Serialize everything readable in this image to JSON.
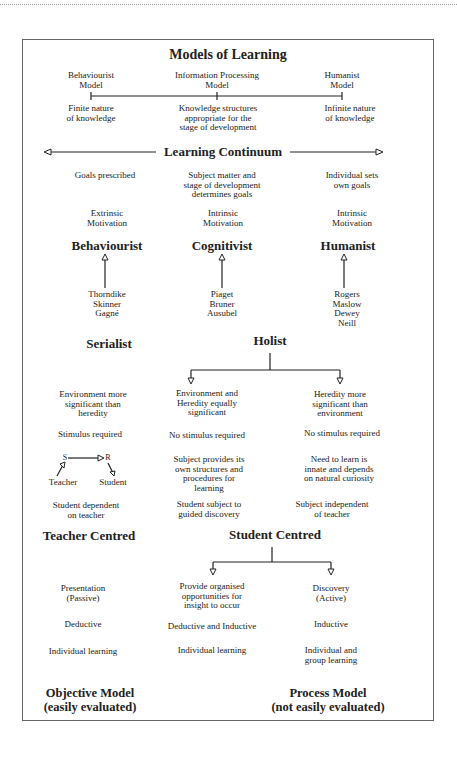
{
  "title": "Models of Learning",
  "models_axis": [
    {
      "label": "Behaviourist\nModel",
      "note": "Finite nature\nof knowledge"
    },
    {
      "label": "Information Processing\nModel",
      "note": "Knowledge structures\nappropriate for the\nstage of development"
    },
    {
      "label": "Humanist\nModel",
      "note": "Infinite nature\nof knowledge"
    }
  ],
  "continuum_label": "Learning Continuum",
  "goals": [
    "Goals prescribed",
    "Subject matter and\nstage of development\ndetermines goals",
    "Individual sets\nown goals"
  ],
  "motivation": [
    "Extrinsic\nMotivation",
    "Intrinsic\nMotivation",
    "Intrinsic\nMotivation"
  ],
  "schools": [
    "Behaviourist",
    "Cognitivist",
    "Humanist"
  ],
  "theorists": [
    "Thorndike\nSkinner\nGagné",
    "Piaget\nBruner\nAusubel",
    "Rogers\nMaslow\nDewey\nNeill"
  ],
  "styles": {
    "serialist": "Serialist",
    "holist": "Holist"
  },
  "environment": [
    "Environment more\nsignificant than\nheredity",
    "Environment and\nHeredity equally\nsignificant",
    "Heredity more\nsignificant than\nenvironment"
  ],
  "stimulus": [
    "Stimulus required",
    "No stimulus required",
    "No stimulus required"
  ],
  "sr_diagram": {
    "s": "S",
    "r": "R",
    "teacher": "Teacher",
    "student": "Student"
  },
  "structures": [
    "Subject provides its\nown structures and\nprocedures for\nlearning",
    "Need to learn is\ninnate and depends\non natural curiosity"
  ],
  "dependence": [
    "Student dependent\non teacher",
    "Student subject to\nguided discovery",
    "Subject independent\nof teacher"
  ],
  "centred": {
    "teacher": "Teacher Centred",
    "student": "Student Centred"
  },
  "presentation": [
    "Presentation\n(Passive)",
    "Provide organised\nopportunities for\ninsight to occur",
    "Discovery\n(Active)"
  ],
  "reasoning": [
    "Deductive",
    "Deductive and Inductive",
    "Inductive"
  ],
  "grouping": [
    "Individual learning",
    "Individual learning",
    "Individual and\ngroup learning"
  ],
  "outcome_models": [
    {
      "name": "Objective Model",
      "sub": "(easily evaluated)"
    },
    {
      "name": "Process Model",
      "sub": "(not easily evaluated)"
    }
  ]
}
